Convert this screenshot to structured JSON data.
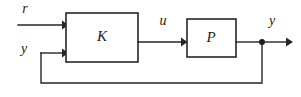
{
  "diagram": {
    "canvas": {
      "width": 301,
      "height": 97,
      "background": "#ffffff"
    },
    "stroke_color": "#262626",
    "text_color": "#1c1c1c",
    "blocks": [
      {
        "id": "controller",
        "label": "K",
        "x": 66,
        "y": 13,
        "width": 72,
        "height": 49,
        "center_x": 102,
        "center_y": 37
      },
      {
        "id": "plant",
        "label": "P",
        "x": 187,
        "y": 19,
        "width": 49,
        "height": 38,
        "center_x": 211,
        "center_y": 38
      }
    ],
    "signals": [
      {
        "id": "reference",
        "label": "r",
        "x": 25,
        "y": 10
      },
      {
        "id": "measured-feedback",
        "label": "y",
        "x": 24,
        "y": 50
      },
      {
        "id": "control-input",
        "label": "u",
        "x": 163,
        "y": 22
      },
      {
        "id": "output",
        "label": "y",
        "x": 272,
        "y": 22
      }
    ],
    "junction": {
      "id": "output-takeoff",
      "x": 262,
      "y": 42,
      "radius": 3
    },
    "wires": [
      {
        "id": "reference-to-controller",
        "points": "18,25 64,25",
        "arrow": "right"
      },
      {
        "id": "feedback-to-controller",
        "points": "41,53 64,53",
        "arrow": "right"
      },
      {
        "id": "controller-to-plant",
        "points": "138,42 185,42",
        "arrow": "right"
      },
      {
        "id": "plant-to-output",
        "points": "236,42 262,42",
        "arrow": "none"
      },
      {
        "id": "output-to-right",
        "points": "262,42 292,42",
        "arrow": "right"
      },
      {
        "id": "feedback-return",
        "points": "262,42 262,83 41,83 41,53",
        "arrow": "none"
      }
    ]
  }
}
